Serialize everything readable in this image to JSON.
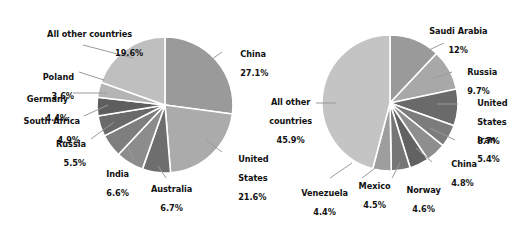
{
  "figure": {
    "background": "#ffffff",
    "leader_line_color": "#9a9a9a",
    "slice_border_color": "#ffffff",
    "text_color": "#111111"
  },
  "chart_data": [
    {
      "type": "pie",
      "name": "left-pie",
      "title": "",
      "start_angle_deg": 0,
      "direction": "clockwise",
      "center": {
        "x": 165,
        "y": 105
      },
      "radius": 68,
      "legend": "labels-outside-with-leader-lines",
      "labels": [
        "China",
        "United States",
        "Australia",
        "India",
        "Russia",
        "South Africa",
        "Germany",
        "Poland",
        "All other countries"
      ],
      "values": [
        27.1,
        21.6,
        6.7,
        6.6,
        5.5,
        4.9,
        4.4,
        3.6,
        19.6
      ],
      "value_labels": [
        "27.1%",
        "21.6%",
        "6.7%",
        "6.6%",
        "5.5%",
        "4.9%",
        "4.4%",
        "3.6%",
        "19.6%"
      ],
      "colors": [
        "#9a9a9a",
        "#ababab",
        "#6e6e6e",
        "#8c8c8c",
        "#7e7e7e",
        "#6a6a6a",
        "#5e5e5e",
        "#b4b4b4",
        "#bfbfbf"
      ],
      "slices": [
        {
          "label": "China",
          "value": 27.1,
          "value_label": "27.1%",
          "color": "#9a9a9a"
        },
        {
          "label": "United States",
          "value": 21.6,
          "value_label": "21.6%",
          "color": "#ababab"
        },
        {
          "label": "Australia",
          "value": 6.7,
          "value_label": "6.7%",
          "color": "#6e6e6e"
        },
        {
          "label": "India",
          "value": 6.6,
          "value_label": "6.6%",
          "color": "#8c8c8c"
        },
        {
          "label": "Russia",
          "value": 5.5,
          "value_label": "5.5%",
          "color": "#7e7e7e"
        },
        {
          "label": "South Africa",
          "value": 4.9,
          "value_label": "4.9%",
          "color": "#6a6a6a"
        },
        {
          "label": "Germany",
          "value": 4.4,
          "value_label": "4.4%",
          "color": "#5e5e5e"
        },
        {
          "label": "Poland",
          "value": 3.6,
          "value_label": "3.6%",
          "color": "#b4b4b4"
        },
        {
          "label": "All other countries",
          "value": 19.6,
          "value_label": "19.6%",
          "color": "#bfbfbf"
        }
      ]
    },
    {
      "type": "pie",
      "name": "right-pie",
      "title": "",
      "start_angle_deg": 0,
      "direction": "clockwise",
      "center": {
        "x": 390,
        "y": 103
      },
      "radius": 68,
      "legend": "labels-outside-with-leader-lines",
      "labels": [
        "Saudi Arabia",
        "Russia",
        "United States",
        "Iran",
        "China",
        "Norway",
        "Mexico",
        "Venezuela",
        "All other countries"
      ],
      "values": [
        12.0,
        9.7,
        8.7,
        5.4,
        4.8,
        4.6,
        4.5,
        4.4,
        45.9
      ],
      "value_labels": [
        "12%",
        "9.7%",
        "8.7%",
        "5.4%",
        "4.8%",
        "4.6%",
        "4.5%",
        "4.4%",
        "45.9%"
      ],
      "colors": [
        "#9a9a9a",
        "#a8a8a8",
        "#6a6a6a",
        "#7c7c7c",
        "#8e8e8e",
        "#626262",
        "#767676",
        "#9e9e9e",
        "#c4c4c4"
      ],
      "slices": [
        {
          "label": "Saudi Arabia",
          "value": 12.0,
          "value_label": "12%",
          "color": "#9a9a9a"
        },
        {
          "label": "Russia",
          "value": 9.7,
          "value_label": "9.7%",
          "color": "#a8a8a8"
        },
        {
          "label": "United States",
          "value": 8.7,
          "value_label": "8.7%",
          "color": "#6a6a6a"
        },
        {
          "label": "Iran",
          "value": 5.4,
          "value_label": "5.4%",
          "color": "#7c7c7c"
        },
        {
          "label": "China",
          "value": 4.8,
          "value_label": "4.8%",
          "color": "#8e8e8e"
        },
        {
          "label": "Norway",
          "value": 4.6,
          "value_label": "4.6%",
          "color": "#626262"
        },
        {
          "label": "Mexico",
          "value": 4.5,
          "value_label": "4.5%",
          "color": "#767676"
        },
        {
          "label": "Venezuela",
          "value": 4.4,
          "value_label": "4.4%",
          "color": "#9e9e9e"
        },
        {
          "label": "All other countries",
          "value": 45.9,
          "value_label": "45.9%",
          "color": "#c4c4c4"
        }
      ]
    }
  ],
  "left_chart": {
    "labels": {
      "all_other": {
        "name": "All other countries",
        "pct": "19.6%"
      },
      "poland": {
        "name": "Poland",
        "pct": "3.6%"
      },
      "germany": {
        "name": "Germany",
        "pct": "4.4%"
      },
      "south_africa": {
        "name": "South Africa",
        "pct": "4.9%"
      },
      "russia": {
        "name": "Russia",
        "pct": "5.5%"
      },
      "india": {
        "name": "India",
        "pct": "6.6%"
      },
      "australia": {
        "name": "Australia",
        "pct": "6.7%"
      },
      "china": {
        "name": "China",
        "pct": "27.1%"
      },
      "united_states": {
        "name1": "United",
        "name2": "States",
        "pct": "21.6%"
      }
    }
  },
  "right_chart": {
    "labels": {
      "saudi_arabia": {
        "name": "Saudi Arabia",
        "pct": "12%"
      },
      "russia": {
        "name": "Russia",
        "pct": "9.7%"
      },
      "united_states": {
        "name1": "United",
        "name2": "States",
        "pct": "8.7%"
      },
      "iran": {
        "name": "Iran",
        "pct": "5.4%"
      },
      "china": {
        "name": "China",
        "pct": "4.8%"
      },
      "norway": {
        "name": "Norway",
        "pct": "4.6%"
      },
      "mexico": {
        "name": "Mexico",
        "pct": "4.5%"
      },
      "venezuela": {
        "name": "Venezuela",
        "pct": "4.4%"
      },
      "all_other": {
        "name1": "All other",
        "name2": "countries",
        "pct": "45.9%"
      }
    }
  }
}
